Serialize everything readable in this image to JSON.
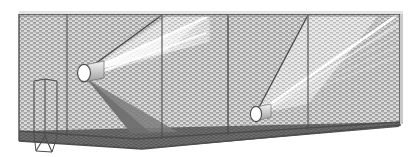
{
  "figure": {
    "type": "technical-line-illustration",
    "canvas": {
      "width": 418,
      "height": 157,
      "background": "#ffffff"
    },
    "palette": {
      "outline": "#4d4d4d",
      "outline_dark": "#3a3a3a",
      "wall_fill": "#d9d9d9",
      "wall_hatch": "#8c8c8c",
      "floor_fill": "#6e6e6e",
      "floor_hatch": "#545454",
      "beam_light": "#ffffff",
      "beam_shadow": "#7a7a7a",
      "emitter_face": "#fdfdfd",
      "emitter_body": "#c6c6c6"
    },
    "structure": {
      "name": "rectangular-enclosure",
      "description": "Long open-fronted box drawn in one-point perspective, interior surfaces filled with a fine brick stipple hatch.",
      "back_wall": {
        "label": "back-wall",
        "fill": "#d9d9d9"
      },
      "floor": {
        "label": "floor-plane",
        "fill": "#6e6e6e"
      },
      "ceiling_edge": {
        "label": "ceiling-edge",
        "stroke": "#4d4d4d"
      },
      "bays": 4,
      "bay_dividers": [
        {
          "label": "divider-1",
          "x": 67
        },
        {
          "label": "divider-2",
          "x": 162
        },
        {
          "label": "divider-3",
          "x": 228
        },
        {
          "label": "divider-4",
          "x": 308
        }
      ]
    },
    "emitters": [
      {
        "label": "emitter-upper-left",
        "shape": "cylinder",
        "face": "ellipse",
        "cx": 84,
        "cy": 73,
        "rx": 7,
        "ry": 9,
        "beam": {
          "label": "light-cone-upper",
          "direction": "up-right",
          "highlight": "#ffffff",
          "shadow_direction": "down-right",
          "shadow": "#7a7a7a"
        }
      },
      {
        "label": "emitter-lower-right",
        "shape": "cylinder",
        "face": "ellipse",
        "cx": 256,
        "cy": 114,
        "rx": 6,
        "ry": 8,
        "beam": {
          "label": "light-cone-lower",
          "direction": "up-right",
          "highlight": "#ffffff",
          "shadow_direction": "up-right",
          "shadow": "#7a7a7a"
        }
      }
    ],
    "accessory": {
      "label": "wall-mounted-panel",
      "description": "Small open box / baffle attached to the back wall near the left end, with a bracket descending below the floor line.",
      "x": 34,
      "y": 81,
      "width": 23,
      "height": 52
    },
    "hatching": {
      "wall_pattern": "brick-stipple",
      "floor_pattern": "fine-stipple",
      "beam_pattern": "diagonal-rays"
    }
  }
}
